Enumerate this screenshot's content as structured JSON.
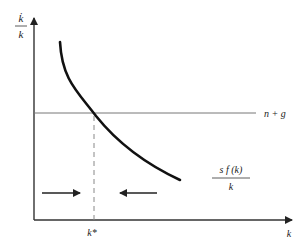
{
  "diagram": {
    "type": "solow-growth-diagram",
    "y_axis": {
      "label_numerator": "k̇",
      "label_denominator": "k",
      "origin": [
        34,
        220
      ],
      "top": [
        34,
        14
      ]
    },
    "x_axis": {
      "label": "k",
      "end": [
        294,
        220
      ]
    },
    "horizontal_line": {
      "label": "n + g",
      "y": 113,
      "x_start": 34,
      "x_end": 256
    },
    "curve": {
      "label_numerator": "s f (k)",
      "label_denominator": "k",
      "path": "M 60 42 C 62 80, 78 92, 96 116 C 120 146, 150 166, 180 180"
    },
    "steady_state": {
      "label": "k*",
      "x": 94
    },
    "arrows": [
      {
        "direction": "right",
        "x1": 42,
        "x2": 80,
        "y": 193
      },
      {
        "direction": "left",
        "x1": 157,
        "x2": 120,
        "y": 193
      }
    ],
    "colors": {
      "axis": "#333333",
      "curve": "#111111",
      "line": "#777777",
      "dashed": "#888888"
    }
  }
}
